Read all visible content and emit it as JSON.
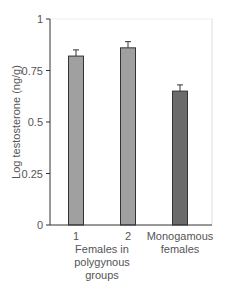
{
  "chart_data": {
    "type": "bar",
    "title": "",
    "xlabel": "",
    "ylabel": "Log testosterone (ng/g)",
    "ylim": [
      0,
      1
    ],
    "yticks": [
      0,
      0.25,
      0.5,
      0.75,
      1
    ],
    "ytick_labels": [
      "0",
      "0.25",
      "0.5",
      "0.75",
      "1"
    ],
    "categories": [
      "1",
      "2",
      "Monogamous females"
    ],
    "group_labels": [
      {
        "label_lines": [
          "Females in",
          "polygynous",
          "groups"
        ],
        "spans": [
          "1",
          "2"
        ]
      }
    ],
    "values": [
      0.82,
      0.86,
      0.65
    ],
    "error_upper": [
      0.85,
      0.89,
      0.68
    ],
    "bar_colors": [
      "#a0a0a0",
      "#a0a0a0",
      "#6b6b6b"
    ],
    "grid": false,
    "legend": null
  },
  "labels": {
    "ylabel": "Log testosterone (ng/g)",
    "ticks": [
      "0",
      "0.25",
      "0.5",
      "0.75",
      "1"
    ],
    "cat1": "1",
    "cat2": "2",
    "cat3_line1": "Monogamous",
    "cat3_line2": "females",
    "group_line1": "Females in",
    "group_line2": "polygynous",
    "group_line3": "groups"
  }
}
